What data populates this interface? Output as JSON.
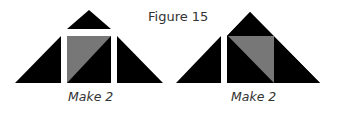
{
  "figure": {
    "title": "Figure 15",
    "diagrams": [
      {
        "caption": "Make 2",
        "description": "Flying-geese style block: top small triangle, left triangle, center square with gray upper-left half-square triangle, right triangle"
      },
      {
        "caption": "Make 2",
        "description": "Large triangle with separated left triangle; center square with gray upper-right half-square triangle"
      }
    ],
    "colors": {
      "fill": "#000000",
      "accent": "#777777",
      "background": "#ffffff"
    }
  }
}
